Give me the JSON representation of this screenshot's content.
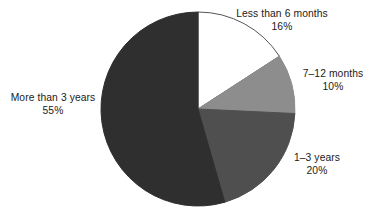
{
  "chart_data": {
    "type": "pie",
    "title": "",
    "subtitle": "",
    "xlabel": "",
    "ylabel": "",
    "legend_position": "none",
    "grid": false,
    "units": "percent",
    "start_angle_deg": 0,
    "direction": "clockwise",
    "categories": [
      "Less than 6 months",
      "7–12 months",
      "1–3 years",
      "More than 3 years"
    ],
    "values": [
      16,
      10,
      20,
      55
    ],
    "value_labels": [
      "16%",
      "10%",
      "20%",
      "55%"
    ],
    "colors": [
      "#ffffff",
      "#8d8d8d",
      "#4f4f4f",
      "#2f2f2f"
    ],
    "slices": [
      {
        "label": "Less than 6 months",
        "value": 16,
        "value_label": "16%",
        "color": "#ffffff",
        "stroke": "#555555"
      },
      {
        "label": "7–12 months",
        "value": 10,
        "value_label": "10%",
        "color": "#8d8d8d",
        "stroke": "#8d8d8d"
      },
      {
        "label": "1–3 years",
        "value": 20,
        "value_label": "20%",
        "color": "#4f4f4f",
        "stroke": "#4f4f4f"
      },
      {
        "label": "More than 3 years",
        "value": 55,
        "value_label": "55%",
        "color": "#2f2f2f",
        "stroke": "#2f2f2f"
      }
    ]
  },
  "geometry": {
    "center_x": 198,
    "center_y": 109,
    "radius": 97
  }
}
